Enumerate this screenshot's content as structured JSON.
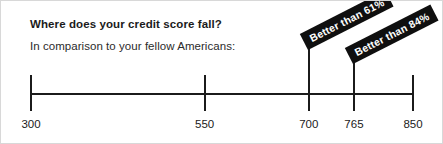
{
  "figure": {
    "headline": "Where does your credit score fall?",
    "subhead": "In comparison to your fellow Americans:",
    "background_color": "#ffffff",
    "axis_color": "#1b1b1b",
    "callout_bg_color": "#0f0f0f",
    "callout_text_color": "#ffffff"
  },
  "chart_data": {
    "type": "line",
    "title": "Where does your credit score fall?",
    "subtitle": "In comparison to your fellow Americans:",
    "xlabel": "",
    "ylabel": "",
    "xlim": [
      300,
      850
    ],
    "grid": false,
    "legend": "none",
    "orientation": "horizontal-number-line",
    "tick_labels": [
      "300",
      "550",
      "700",
      "765",
      "850"
    ],
    "tick_values": [
      300,
      550,
      700,
      765,
      850
    ],
    "markers": [
      {
        "value": 700,
        "label": "Better than 61%",
        "percentile": 61,
        "rotation_deg": -27
      },
      {
        "value": 765,
        "label": "Better than 84%",
        "percentile": 84,
        "rotation_deg": -27
      }
    ]
  }
}
